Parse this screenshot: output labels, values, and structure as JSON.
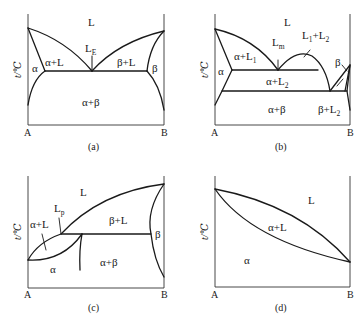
{
  "figure": {
    "axis_label": "t/℃",
    "end_left": "A",
    "end_right": "B",
    "panels": [
      {
        "id": "a",
        "caption": "(a)",
        "type": "eutectic",
        "regions": {
          "liquid": "L",
          "alpha": "α",
          "beta": "β",
          "alpha_liquid": "α+L",
          "beta_liquid": "β+L",
          "alpha_beta": "α+β"
        },
        "point_label": {
          "main": "L",
          "sub": "E"
        }
      },
      {
        "id": "b",
        "caption": "(b)",
        "type": "monotectic",
        "regions": {
          "liquid": "L",
          "alpha": "α",
          "beta": "β",
          "alpha_l1": {
            "main": "α+L",
            "sub": "1"
          },
          "l1_l2": {
            "main": "L",
            "sub1": "1",
            "mid": "+L",
            "sub2": "2"
          },
          "alpha_l2": {
            "main": "α+L",
            "sub": "2"
          },
          "alpha_beta": "α+β",
          "beta_l2": {
            "main": "β+L",
            "sub": "2"
          }
        },
        "point_label": {
          "main": "L",
          "sub": "m"
        }
      },
      {
        "id": "c",
        "caption": "(c)",
        "type": "peritectic",
        "regions": {
          "liquid": "L",
          "alpha": "α",
          "beta": "β",
          "alpha_liquid": "α+L",
          "beta_liquid": "β+L",
          "alpha_beta": "α+β"
        },
        "point_label": {
          "main": "L",
          "sub": "p"
        }
      },
      {
        "id": "d",
        "caption": "(d)",
        "type": "isomorphous",
        "regions": {
          "liquid": "L",
          "alpha": "α",
          "alpha_liquid": "α+L"
        }
      }
    ]
  }
}
